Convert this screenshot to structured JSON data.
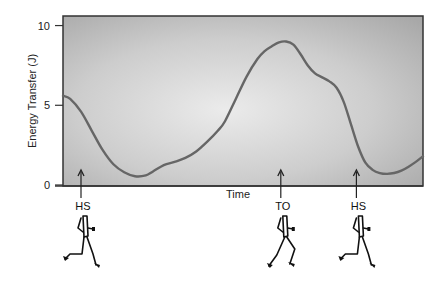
{
  "chart_data": {
    "type": "line",
    "title": "",
    "xlabel": "Time",
    "ylabel": "Energy Transfer (J)",
    "ylim": [
      0,
      10.6
    ],
    "xlim": [
      0,
      100
    ],
    "yticks": [
      0,
      5,
      10
    ],
    "ytick_labels": [
      "0",
      "5",
      "10"
    ],
    "grid": false,
    "legend": "none",
    "series": [
      {
        "name": "Energy Transfer",
        "color": "#666666",
        "x": [
          0,
          2,
          5,
          8,
          11,
          14,
          17,
          20,
          23,
          25,
          28,
          31,
          34,
          37,
          40,
          43,
          45,
          48,
          51,
          54,
          56,
          58,
          60,
          62,
          64,
          66,
          68,
          70,
          72,
          74,
          76,
          78,
          80,
          82,
          84,
          86,
          88,
          90,
          92,
          94,
          96,
          98,
          100
        ],
        "values": [
          5.6,
          5.4,
          4.6,
          3.4,
          2.2,
          1.3,
          0.8,
          0.55,
          0.6,
          0.85,
          1.25,
          1.45,
          1.7,
          2.1,
          2.7,
          3.4,
          4.0,
          5.4,
          6.8,
          7.9,
          8.4,
          8.7,
          8.95,
          9.0,
          8.8,
          8.2,
          7.5,
          7.0,
          6.75,
          6.5,
          6.1,
          5.2,
          3.8,
          2.4,
          1.4,
          0.95,
          0.75,
          0.7,
          0.75,
          0.9,
          1.15,
          1.45,
          1.8
        ]
      }
    ],
    "annotations": [
      {
        "label": "HS",
        "x": 5,
        "marker": "arrow-up",
        "figure": "runner-heel-strike"
      },
      {
        "label": "TO",
        "x": 60.5,
        "marker": "arrow-up",
        "figure": "runner-toe-off"
      },
      {
        "label": "HS",
        "x": 81.5,
        "marker": "arrow-up",
        "figure": "runner-heel-strike"
      }
    ],
    "colors": {
      "plot_bg_center": "#e8e8e8",
      "plot_bg_edge": "#a9a9a9",
      "frame": "#333333",
      "line": "#666666"
    }
  }
}
